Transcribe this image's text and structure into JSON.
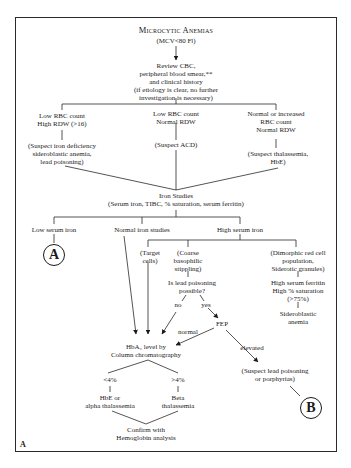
{
  "diagram": {
    "title": "Microcytic Anemias",
    "subtitle": "(MCV<80 Fl)",
    "panel_label": "A",
    "nodes": {
      "review": [
        "Review CBC,",
        "peripheral blood smear,**",
        "and clinical history",
        "(if etiology is clear, no further",
        "investigation is necessary)"
      ],
      "branch_left": [
        "Low RBC count",
        "High RDW (>16)"
      ],
      "branch_mid": [
        "Low RBC count",
        "Normal RDW"
      ],
      "branch_right": [
        "Normal or increased",
        "RBC count",
        "Normal RDW"
      ],
      "suspect_left": [
        "(Suspect iron deficiency",
        "sideroblastic anemia,",
        "lead poisoning)"
      ],
      "suspect_mid": [
        "(Suspect ACD)"
      ],
      "suspect_right": [
        "(Suspect thalassemia,",
        "HbE)"
      ],
      "iron_studies": [
        "Iron Studies",
        "(Serum iron, TIBC, % saturation, serum ferritin)"
      ],
      "low_serum_iron": "Low serum iron",
      "normal_iron": "Normal iron studies",
      "high_serum_iron": "High serum iron",
      "target_cells": [
        "(Target",
        "cells)"
      ],
      "coarse": [
        "(Coarse",
        "basophilic",
        "stippling)"
      ],
      "dimorphic": [
        "(Dimorphic red cell",
        "population,",
        "Siderotic granules)"
      ],
      "lead_q": [
        "Is lead poisoning",
        "possible?"
      ],
      "no": "no",
      "yes": "yes",
      "high_ferritin": [
        "High serum ferritin",
        "High % saturation",
        "(>75%)"
      ],
      "sideroblastic": [
        "Sideroblastic",
        "anemia"
      ],
      "fep": "FEP",
      "normal": "normal",
      "elevated": "elevated",
      "hba2": [
        "HbA₂ level by",
        "Column chromatography"
      ],
      "lt4": "<4%",
      "gt4": ">4%",
      "hbe_alpha": [
        "HbE or",
        "alpha thalassemia"
      ],
      "beta": [
        "Beta",
        "thalassemia"
      ],
      "suspect_lead": [
        "(Suspect lead poisoning",
        "or porphyrias)"
      ],
      "confirm": [
        "Confirm with",
        "Hemoglobin analysis"
      ],
      "connector_a": "A",
      "connector_b": "B"
    }
  }
}
